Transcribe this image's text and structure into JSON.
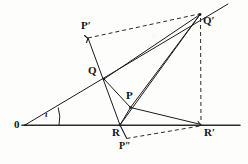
{
  "figure": {
    "background": "#fdfdfb",
    "ink": "#1b1c20",
    "points": {
      "O": {
        "label": "0",
        "x": 25,
        "y": 125,
        "label_x": 14,
        "label_y": 120
      },
      "Pp": {
        "label": "P′",
        "x": 88,
        "y": 38,
        "label_x": 82,
        "label_y": 21
      },
      "Q": {
        "label": "Q",
        "x": 104,
        "y": 79,
        "label_x": 89,
        "label_y": 66
      },
      "P": {
        "label": "P",
        "x": 130,
        "y": 107,
        "label_x": 126,
        "label_y": 91
      },
      "R": {
        "label": "R",
        "x": 120,
        "y": 125,
        "label_x": 113,
        "label_y": 127
      },
      "Rp": {
        "label": "R′",
        "x": 201,
        "y": 125,
        "label_x": 204,
        "label_y": 127
      },
      "Qp": {
        "label": "Q′",
        "x": 200,
        "y": 14,
        "label_x": 203,
        "label_y": 16
      },
      "Ppp": {
        "label": "P″",
        "x": 126,
        "y": 138,
        "label_x": 120,
        "label_y": 142
      }
    },
    "angle": {
      "symbol": "ι",
      "x": 46,
      "y": 112,
      "vertex": "O"
    },
    "axis": {
      "x_start": 22,
      "x_end": 240,
      "y": 125
    },
    "ray_extension": {
      "x_end": 228,
      "y_end": 4
    },
    "solid_edges": [
      {
        "name": "axis-line",
        "from": [
          22,
          125
        ],
        "to": [
          240,
          125
        ]
      },
      {
        "name": "ray-O-Qprime",
        "from": [
          25,
          125
        ],
        "to": [
          228,
          4
        ]
      },
      {
        "name": "edge-Pprime-R",
        "from": [
          88,
          38
        ],
        "to": [
          120,
          125
        ]
      },
      {
        "name": "edge-Q-Qprime",
        "from": [
          104,
          79
        ],
        "to": [
          200,
          14
        ]
      },
      {
        "name": "edge-Q-P",
        "from": [
          104,
          79
        ],
        "to": [
          130,
          107
        ]
      },
      {
        "name": "edge-P-Qprime",
        "from": [
          130,
          107
        ],
        "to": [
          200,
          14
        ]
      },
      {
        "name": "edge-P-Rprime",
        "from": [
          130,
          107
        ],
        "to": [
          201,
          125
        ]
      },
      {
        "name": "edge-P-R",
        "from": [
          130,
          107
        ],
        "to": [
          120,
          125
        ]
      },
      {
        "name": "edge-R-Qprime",
        "from": [
          120,
          125
        ],
        "to": [
          200,
          14
        ]
      },
      {
        "name": "edge-R-Pdprime",
        "from": [
          120,
          125
        ],
        "to": [
          126,
          138
        ]
      }
    ],
    "dashed_edges": [
      {
        "name": "dash-Pprime-Qprime",
        "from": [
          88,
          38
        ],
        "to": [
          200,
          14
        ]
      },
      {
        "name": "dash-Qprime-Rprime",
        "from": [
          200,
          16
        ],
        "to": [
          201,
          124
        ]
      },
      {
        "name": "dash-Pdprime-Rprime",
        "from": [
          126,
          138
        ],
        "to": [
          200,
          126
        ]
      }
    ],
    "angle_arc": {
      "cx": 25,
      "cy": 125,
      "r": 34,
      "start_deg": -30.8,
      "end_deg": 0
    }
  }
}
